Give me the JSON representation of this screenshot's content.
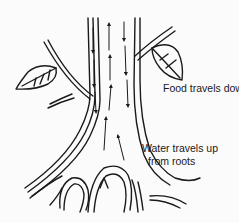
{
  "diagram": {
    "labels": {
      "food": "Food travels down",
      "water_line1": "Water travels up",
      "water_line2": "from roots"
    },
    "arrows": {
      "phloem_direction": "down",
      "xylem_direction": "up"
    },
    "colors": {
      "ink": "#1a1a1a",
      "background": "#fbfbfb"
    }
  }
}
